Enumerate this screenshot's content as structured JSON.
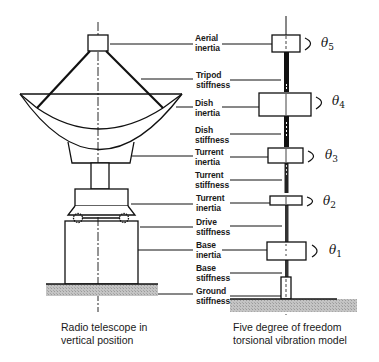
{
  "diagram": {
    "left_caption": [
      "Radio telescope in",
      "vertical position"
    ],
    "right_caption": [
      "Five degree of freedom",
      "torsional vibration model"
    ],
    "labels": [
      {
        "line1": "Aerial",
        "line2": "inertia"
      },
      {
        "line1": "Tripod",
        "line2": "stiffness"
      },
      {
        "line1": "Dish",
        "line2": "inertia"
      },
      {
        "line1": "Dish",
        "line2": "stiffness"
      },
      {
        "line1": "Turrent",
        "line2": "inertia"
      },
      {
        "line1": "Turrent",
        "line2": "stiffness"
      },
      {
        "line1": "Turrent",
        "line2": "inertia"
      },
      {
        "line1": "Drive",
        "line2": "stiffness"
      },
      {
        "line1": "Base",
        "line2": "inertia"
      },
      {
        "line1": "Base",
        "line2": "stiffness"
      },
      {
        "line1": "Ground",
        "line2": "stiffness"
      }
    ],
    "thetas": [
      {
        "symbol": "θ",
        "sub": "5"
      },
      {
        "symbol": "θ",
        "sub": "4"
      },
      {
        "symbol": "θ",
        "sub": "3"
      },
      {
        "symbol": "θ",
        "sub": "2"
      },
      {
        "symbol": "θ",
        "sub": "1"
      }
    ],
    "colors": {
      "ink": "#111111",
      "ground": "#b8b8b8"
    }
  }
}
